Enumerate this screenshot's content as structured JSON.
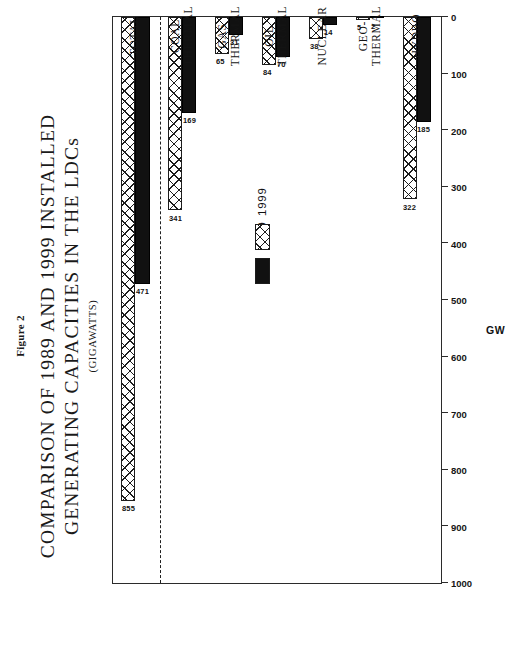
{
  "figure": {
    "number_label": "Figure 2",
    "title_line_1": "COMPARISON OF 1989 AND 1999 INSTALLED",
    "title_line_2": "GENERATING CAPACITIES IN THE LDCs",
    "subtitle": "(GIGAWATTS)"
  },
  "legend": {
    "position": "inside-plot-left",
    "entries": [
      {
        "label": "1989",
        "fill": "solid-black",
        "color": "#111111"
      },
      {
        "label": "1999",
        "fill": "cross-hatch",
        "color": "#1c1c1c"
      }
    ]
  },
  "axis": {
    "value_axis_title": "GW",
    "value_ticks": [
      1000,
      900,
      800,
      700,
      600,
      500,
      400,
      300,
      200,
      100,
      0
    ],
    "value_tick_labels": [
      "1000",
      "900",
      "800",
      "700",
      "600",
      "500",
      "400",
      "300",
      "200",
      "100",
      "0"
    ]
  },
  "chart_data": {
    "type": "bar",
    "orientation": "horizontal",
    "title": "COMPARISON OF 1989 AND 1999 INSTALLED GENERATING CAPACITIES IN THE LDCs",
    "subtitle": "(GIGAWATTS)",
    "figure_label": "Figure 2",
    "xlabel": "GW",
    "ylabel": "",
    "xlim": [
      0,
      1000
    ],
    "grid": false,
    "legend_position": "inside-left",
    "categories": [
      "HYDRO",
      "GEO-\nTHERMAL",
      "NUCLEAR",
      "OIL\nTHERMAL",
      "GAS\nTHERMAL",
      "COAL\nTHERMAL",
      "TOTAL"
    ],
    "category_labels": [
      "HYDRO",
      "GEO-THERMAL",
      "NUCLEAR",
      "OIL THERMAL",
      "GAS THERMAL",
      "COAL THERMAL",
      "TOTAL"
    ],
    "series": [
      {
        "name": "1989",
        "values": [
          185,
          2,
          14,
          70,
          31,
          169,
          471
        ]
      },
      {
        "name": "1999",
        "values": [
          322,
          5,
          38,
          84,
          65,
          341,
          855
        ]
      }
    ],
    "annotations": [
      {
        "text": "dashed separator between the individual sources and the TOTAL group"
      }
    ]
  }
}
